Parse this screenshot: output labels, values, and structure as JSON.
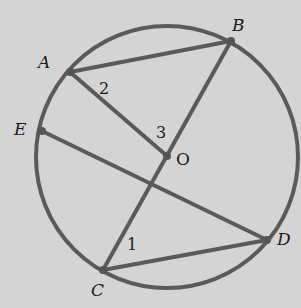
{
  "diagram": {
    "type": "circle-geometry",
    "background": "#d4d4d4",
    "stroke_color": "#5a5a5a",
    "circle": {
      "center": [
        167,
        157
      ],
      "radius": 131
    },
    "points": {
      "A": {
        "label": "A",
        "x": 70,
        "y": 72
      },
      "B": {
        "label": "B",
        "x": 231,
        "y": 41
      },
      "E": {
        "label": "E",
        "x": 42,
        "y": 131
      },
      "O": {
        "label": "O",
        "x": 167,
        "y": 156
      },
      "C": {
        "label": "C",
        "x": 103,
        "y": 270
      },
      "D": {
        "label": "D",
        "x": 267,
        "y": 240
      }
    },
    "segments": [
      {
        "from": "A",
        "to": "B"
      },
      {
        "from": "A",
        "to": "O"
      },
      {
        "from": "B",
        "to": "C"
      },
      {
        "from": "E",
        "to": "D"
      },
      {
        "from": "C",
        "to": "D"
      }
    ],
    "angle_labels": {
      "one": "1",
      "two": "2",
      "three": "3"
    }
  }
}
